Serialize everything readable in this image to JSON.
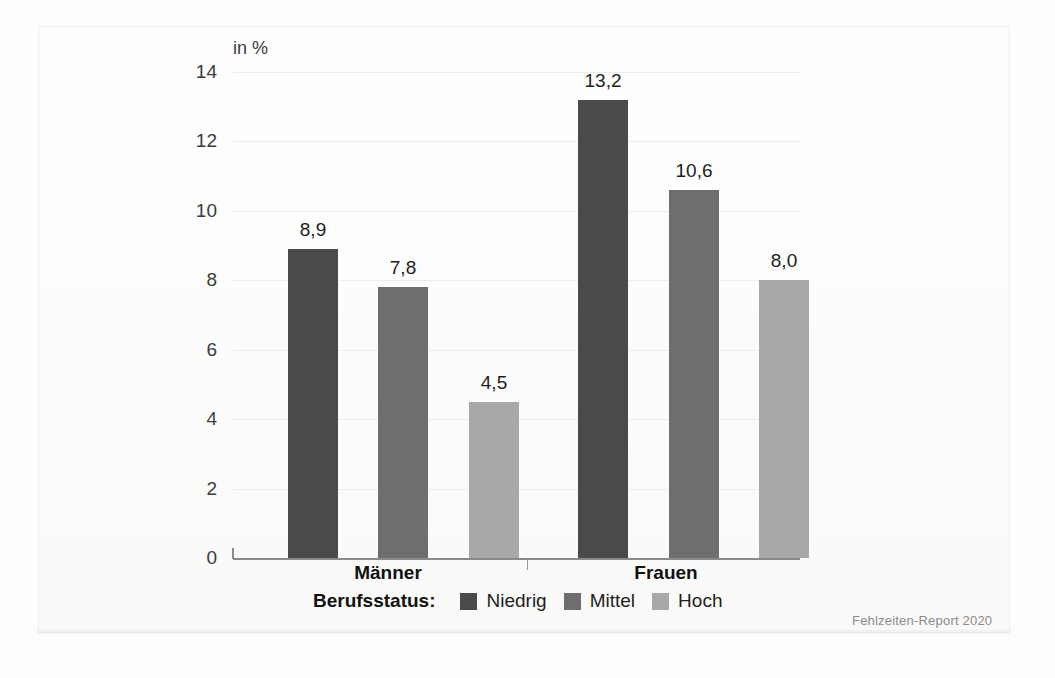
{
  "chart_data": {
    "type": "bar",
    "title": "",
    "subtitle": "",
    "xlabel": "",
    "ylabel": "in %",
    "categories": [
      "Männer",
      "Frauen"
    ],
    "series": [
      {
        "name": "Niedrig",
        "values": [
          8.9,
          13.2
        ],
        "labels": [
          "8,9",
          "13,2"
        ],
        "color": "#4a4a4a"
      },
      {
        "name": "Mittel",
        "values": [
          7.8,
          10.6
        ],
        "labels": [
          "7,8",
          "10,6"
        ],
        "color": "#6e6e6e"
      },
      {
        "name": "Hoch",
        "values": [
          4.5,
          8.0
        ],
        "labels": [
          "4,5",
          "8,0"
        ],
        "color": "#a8a8a8"
      }
    ],
    "ylim": [
      0,
      14
    ],
    "yticks": [
      0,
      2,
      4,
      6,
      8,
      10,
      12,
      14
    ],
    "ytick_labels": [
      "0",
      "2",
      "4",
      "6",
      "8",
      "10",
      "12",
      "14"
    ],
    "grid": true,
    "legend_position": "bottom",
    "legend_title": "Berufsstatus:",
    "value_labels_shown": true
  },
  "axis": {
    "unit_label": "in %",
    "ticks": [
      {
        "value": 14,
        "label": "14"
      },
      {
        "value": 12,
        "label": "12"
      },
      {
        "value": 10,
        "label": "10"
      },
      {
        "value": 8,
        "label": "8"
      },
      {
        "value": 6,
        "label": "6"
      },
      {
        "value": 4,
        "label": "4"
      },
      {
        "value": 2,
        "label": "2"
      },
      {
        "value": 0,
        "label": "0"
      }
    ]
  },
  "groups": [
    {
      "label": "Männer",
      "bars": [
        {
          "series": "Niedrig",
          "value": 8.9,
          "label": "8,9"
        },
        {
          "series": "Mittel",
          "value": 7.8,
          "label": "7,8"
        },
        {
          "series": "Hoch",
          "value": 4.5,
          "label": "4,5"
        }
      ]
    },
    {
      "label": "Frauen",
      "bars": [
        {
          "series": "Niedrig",
          "value": 13.2,
          "label": "13,2"
        },
        {
          "series": "Mittel",
          "value": 10.6,
          "label": "10,6"
        },
        {
          "series": "Hoch",
          "value": 8.0,
          "label": "8,0"
        }
      ]
    }
  ],
  "legend": {
    "title": "Berufsstatus:",
    "items": [
      {
        "label": "Niedrig",
        "color": "#4a4a4a"
      },
      {
        "label": "Mittel",
        "color": "#6e6e6e"
      },
      {
        "label": "Hoch",
        "color": "#a8a8a8"
      }
    ]
  },
  "footer": {
    "source": "Fehlzeiten-Report 2020"
  },
  "colors": {
    "niedrig": "#4a4a4a",
    "mittel": "#6e6e6e",
    "hoch": "#a8a8a8",
    "gridline": "#ececec",
    "baseline": "#8a8a8a",
    "text": "#1e1e1e",
    "background": "#fdfdfc"
  }
}
